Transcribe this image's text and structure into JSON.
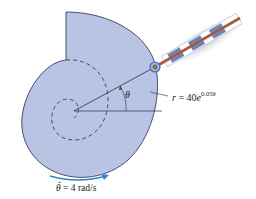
{
  "figure": {
    "type": "mechanism-diagram",
    "labels": {
      "r_equation_lhs": "r",
      "r_equation_eq": " = 40",
      "r_equation_base": "e",
      "r_equation_exp": "0.05θ",
      "theta": "θ",
      "omega_symbol": "θ",
      "omega_rest": " = 4 rad/s"
    },
    "colors": {
      "cam_fill": "#b9c3e3",
      "cam_stroke": "#3a3f5c",
      "rod": "#b5664e",
      "sleeve": "#6a86b8",
      "arrow": "#2a86c8",
      "roller": "#3c6db5"
    }
  }
}
